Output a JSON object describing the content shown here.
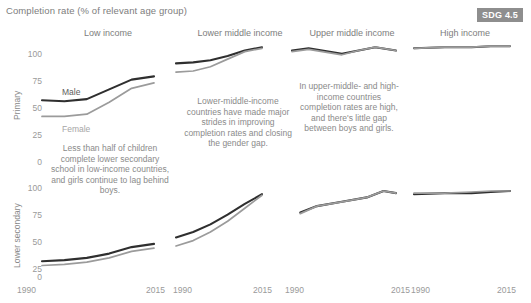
{
  "header": {
    "title": "Completion rate (% of relevant age group)",
    "badge": "SDG 4.5"
  },
  "panels": [
    {
      "title": "Low income"
    },
    {
      "title": "Lower middle income"
    },
    {
      "title": "Upper middle income"
    },
    {
      "title": "High income"
    }
  ],
  "rows": [
    {
      "label": "Primary"
    },
    {
      "label": "Lower secondary"
    }
  ],
  "series_labels": {
    "male": "Male",
    "female": "Female"
  },
  "axis": {
    "yticks": [
      "100",
      "75",
      "50",
      "25",
      "0"
    ],
    "xticks": [
      "1990",
      "2015"
    ]
  },
  "notes": [
    {
      "text": "Less than half of children complete lower secondary school in low-income countries, and girls continue to lag behind boys."
    },
    {
      "text": "Lower-middle-income countries have made major strides in improving completion rates and closing the gender gap."
    },
    {
      "text": "In upper-middle- and high- income countries completion rates are high, and there's little gap between boys and girls."
    }
  ],
  "colors": {
    "male": "#2f2f2f",
    "female": "#9b9b9b",
    "text": "#8a8a8a",
    "badge_bg": "#8e8e8e"
  },
  "chart_data": {
    "type": "line",
    "title": "Completion rate (% of relevant age group)",
    "xlabel": "",
    "ylabel": "Completion rate (% of relevant age group)",
    "xlim": [
      1990,
      2015
    ],
    "ylim": [
      0,
      100
    ],
    "grid": false,
    "legend": "inline-labels",
    "facets": {
      "columns": [
        "Low income",
        "Lower middle income",
        "Upper middle income",
        "High income"
      ],
      "rows": [
        "Primary",
        "Lower secondary"
      ]
    },
    "panels": [
      {
        "row": "Primary",
        "column": "Low income",
        "series": [
          {
            "name": "Male",
            "x": [
              1990,
              1995,
              2000,
              2005,
              2010,
              2015
            ],
            "values": [
              48,
              47,
              49,
              58,
              67,
              70
            ]
          },
          {
            "name": "Female",
            "x": [
              1990,
              1995,
              2000,
              2005,
              2010,
              2015
            ],
            "values": [
              33,
              33,
              35,
              46,
              59,
              64
            ]
          }
        ]
      },
      {
        "row": "Primary",
        "column": "Lower middle income",
        "series": [
          {
            "name": "Male",
            "x": [
              1990,
              1995,
              2000,
              2005,
              2010,
              2015
            ],
            "values": [
              82,
              83,
              85,
              89,
              94,
              97
            ]
          },
          {
            "name": "Female",
            "x": [
              1990,
              1995,
              2000,
              2005,
              2010,
              2015
            ],
            "values": [
              74,
              75,
              79,
              86,
              93,
              96
            ]
          }
        ]
      },
      {
        "row": "Primary",
        "column": "Upper middle income",
        "series": [
          {
            "name": "Male",
            "x": [
              1990,
              1994,
              2002,
              2006,
              2010,
              2015
            ],
            "values": [
              94,
              96,
              91,
              94,
              97,
              94
            ]
          },
          {
            "name": "Female",
            "x": [
              1990,
              1994,
              2002,
              2006,
              2010,
              2015
            ],
            "values": [
              93,
              95,
              90,
              94,
              97,
              94
            ]
          }
        ]
      },
      {
        "row": "Primary",
        "column": "High income",
        "series": [
          {
            "name": "Male",
            "x": [
              1990,
              1998,
              2005,
              2010,
              2015
            ],
            "values": [
              96,
              97,
              97,
              98,
              98
            ]
          },
          {
            "name": "Female",
            "x": [
              1990,
              1998,
              2005,
              2010,
              2015
            ],
            "values": [
              96,
              97,
              97,
              98,
              98
            ]
          }
        ]
      },
      {
        "row": "Lower secondary",
        "column": "Low income",
        "series": [
          {
            "name": "Male",
            "x": [
              1990,
              1995,
              2000,
              2005,
              2010,
              2015
            ],
            "values": [
              23,
              24,
              26,
              30,
              36,
              39
            ]
          },
          {
            "name": "Female",
            "x": [
              1990,
              1995,
              2000,
              2005,
              2010,
              2015
            ],
            "values": [
              19,
              20,
              22,
              26,
              32,
              35
            ]
          }
        ]
      },
      {
        "row": "Lower secondary",
        "column": "Lower middle income",
        "series": [
          {
            "name": "Male",
            "x": [
              1990,
              1995,
              2000,
              2005,
              2010,
              2015
            ],
            "values": [
              45,
              50,
              57,
              66,
              76,
              85
            ]
          },
          {
            "name": "Female",
            "x": [
              1990,
              1995,
              2000,
              2005,
              2010,
              2015
            ],
            "values": [
              37,
              42,
              50,
              60,
              72,
              84
            ]
          }
        ]
      },
      {
        "row": "Lower secondary",
        "column": "Upper middle income",
        "series": [
          {
            "name": "Male",
            "x": [
              1992,
              1996,
              2002,
              2008,
              2012,
              2015
            ],
            "values": [
              68,
              74,
              78,
              82,
              88,
              86
            ]
          },
          {
            "name": "Female",
            "x": [
              1992,
              1996,
              2002,
              2008,
              2012,
              2015
            ],
            "values": [
              67,
              74,
              78,
              82,
              88,
              86
            ]
          }
        ]
      },
      {
        "row": "Lower secondary",
        "column": "High income",
        "series": [
          {
            "name": "Male",
            "x": [
              1990,
              1998,
              2005,
              2010,
              2015
            ],
            "values": [
              85,
              86,
              86,
              87,
              88
            ]
          },
          {
            "name": "Female",
            "x": [
              1990,
              1998,
              2005,
              2010,
              2015
            ],
            "values": [
              86,
              86,
              87,
              88,
              88
            ]
          }
        ]
      }
    ]
  }
}
